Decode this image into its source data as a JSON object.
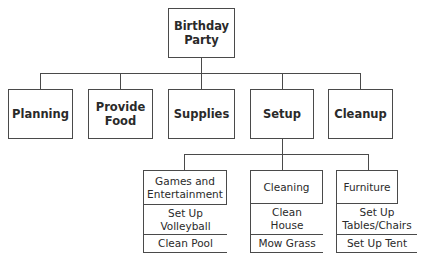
{
  "root": {
    "label": "Birthday Party"
  },
  "level1": [
    {
      "label": "Planning"
    },
    {
      "label": "Provide Food"
    },
    {
      "label": "Supplies"
    },
    {
      "label": "Setup"
    },
    {
      "label": "Cleanup"
    }
  ],
  "setup_children": [
    {
      "label": "Games and Entertainment",
      "items": [
        "Set Up Volleyball",
        "Clean Pool"
      ]
    },
    {
      "label": "Cleaning",
      "items": [
        "Clean House",
        "Mow Grass"
      ]
    },
    {
      "label": "Furniture",
      "items": [
        "Set Up Tables/Chairs",
        "Set Up Tent"
      ]
    }
  ]
}
